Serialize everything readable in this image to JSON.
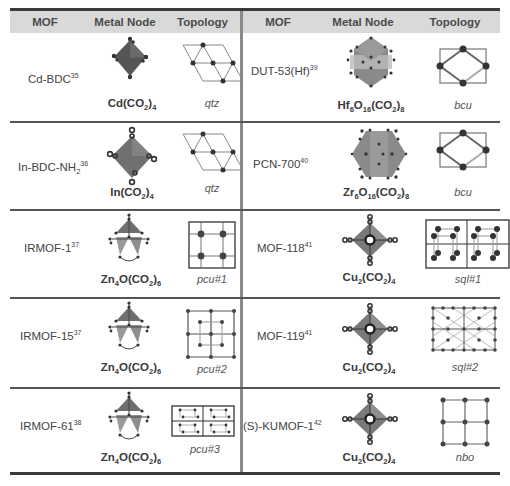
{
  "header": {
    "left": {
      "mof": "MOF",
      "metal_node": "Metal Node",
      "topology": "Topology"
    },
    "right": {
      "mof": "MOF",
      "metal_node": "Metal Node",
      "topology": "Topology"
    }
  },
  "rows": [
    {
      "left": {
        "mof": "Cd-BDC",
        "ref": "35",
        "node": [
          "Cd(CO",
          "2",
          ")",
          "4",
          "",
          ""
        ],
        "topology": "qtz",
        "node_icon": "cd-paddle-node-icon",
        "topo_icon": "qtz-net-icon"
      },
      "right": {
        "mof": "DUT-53(Hf)",
        "ref": "39",
        "node": [
          "Hf",
          "6",
          "O",
          "16",
          "(CO",
          "2",
          ")",
          "8"
        ],
        "topology": "bcu",
        "node_icon": "hf6-cluster-icon",
        "topo_icon": "bcu-net-icon"
      }
    },
    {
      "left": {
        "mof": "In-BDC-NH",
        "sub": "2",
        "ref": "36",
        "node": [
          "In(CO",
          "2",
          ")",
          "4"
        ],
        "topology": "qtz",
        "node_icon": "in-node-icon",
        "topo_icon": "qtz-net-icon"
      },
      "right": {
        "mof": "PCN-700",
        "ref": "40",
        "node": [
          "Zr",
          "6",
          "O",
          "16",
          "(CO",
          "2",
          ")",
          "8"
        ],
        "topology": "bcu",
        "node_icon": "zr6-cluster-icon",
        "topo_icon": "bcu-net-icon"
      }
    },
    {
      "left": {
        "mof": "IRMOF-1",
        "ref": "37",
        "node": [
          "Zn",
          "4",
          "O(CO",
          "2",
          ")",
          "6"
        ],
        "topology": "pcu#1",
        "node_icon": "zn4o-cluster-icon",
        "topo_icon": "pcu1-net-icon"
      },
      "right": {
        "mof": "MOF-118",
        "ref": "41",
        "node": [
          "Cu",
          "2",
          "(CO",
          "2",
          ")",
          "4"
        ],
        "topology": "sql#1",
        "node_icon": "cu-paddlewheel-icon",
        "topo_icon": "sql1-net-icon"
      }
    },
    {
      "left": {
        "mof": "IRMOF-15",
        "ref": "37",
        "node": [
          "Zn",
          "4",
          "O(CO",
          "2",
          ")",
          "6"
        ],
        "topology": "pcu#2",
        "node_icon": "zn4o-cluster-icon",
        "topo_icon": "pcu2-net-icon"
      },
      "right": {
        "mof": "MOF-119",
        "ref": "41",
        "node": [
          "Cu",
          "2",
          "(CO",
          "2",
          ")",
          "4"
        ],
        "topology": "sql#2",
        "node_icon": "cu-paddlewheel-icon",
        "topo_icon": "sql2-net-icon"
      }
    },
    {
      "left": {
        "mof": "IRMOF-61",
        "ref": "38",
        "node": [
          "Zn",
          "4",
          "O(CO",
          "2",
          ")",
          "6"
        ],
        "topology": "pcu#3",
        "node_icon": "zn4o-cluster-icon",
        "topo_icon": "pcu3-net-icon"
      },
      "right": {
        "mof": "(S)-KUMOF-1",
        "ref": "42",
        "node": [
          "Cu",
          "2",
          "(CO",
          "2",
          ")",
          "4"
        ],
        "topology": "nbo",
        "node_icon": "cu-paddlewheel-icon",
        "topo_icon": "nbo-net-icon"
      }
    }
  ],
  "colors": {
    "header_bg": "#d9d9d9",
    "rule": "#3a3a3a",
    "divider": "#8a8a8a",
    "node_dark": "#555555",
    "node_mid": "#8c8c8c",
    "atom": "#333333"
  }
}
